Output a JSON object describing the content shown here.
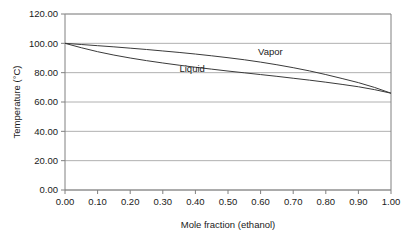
{
  "chart_data": {
    "type": "line",
    "title": "",
    "xlabel": "Mole fraction (ethanol)",
    "ylabel": "Temperature (°C)",
    "xlim": [
      0.0,
      1.0
    ],
    "ylim": [
      0.0,
      120.0
    ],
    "xticks": [
      "0.00",
      "0.10",
      "0.20",
      "0.30",
      "0.40",
      "0.50",
      "0.60",
      "0.70",
      "0.80",
      "0.90",
      "1.00"
    ],
    "xtick_values": [
      0.0,
      0.1,
      0.2,
      0.3,
      0.4,
      0.5,
      0.6,
      0.7,
      0.8,
      0.9,
      1.0
    ],
    "yticks": [
      "0.00",
      "20.00",
      "40.00",
      "60.00",
      "80.00",
      "100.00",
      "120.00"
    ],
    "ytick_values": [
      0,
      20,
      40,
      60,
      80,
      100,
      120
    ],
    "grid": "horizontal",
    "legend_position": "inline-annotation",
    "line_color": "#3a3a3a",
    "grid_color": "#b0b0b0",
    "frame_color": "#808080",
    "annotations": [
      {
        "text": "Vapor",
        "x": 0.63,
        "y": 92.0
      },
      {
        "text": "Liquid",
        "x": 0.39,
        "y": 80.5
      }
    ],
    "x": [
      0.0,
      0.05,
      0.1,
      0.15,
      0.2,
      0.25,
      0.3,
      0.35,
      0.4,
      0.45,
      0.5,
      0.55,
      0.6,
      0.65,
      0.7,
      0.75,
      0.8,
      0.85,
      0.9,
      0.95,
      1.0
    ],
    "series": [
      {
        "name": "Vapor",
        "values": [
          100.0,
          99.2,
          98.4,
          97.6,
          96.7,
          95.8,
          94.8,
          93.8,
          92.7,
          91.5,
          90.2,
          88.8,
          87.2,
          85.4,
          83.4,
          81.2,
          78.7,
          76.0,
          73.2,
          69.9,
          66.0
        ]
      },
      {
        "name": "Liquid",
        "values": [
          100.0,
          97.0,
          94.3,
          92.0,
          90.0,
          88.2,
          86.6,
          85.1,
          83.7,
          82.4,
          81.1,
          79.9,
          78.7,
          77.5,
          76.2,
          74.9,
          73.5,
          72.0,
          70.4,
          68.4,
          66.0
        ]
      }
    ]
  },
  "axes": {
    "y_title": "Temperature (°C)",
    "x_title": "Mole fraction (ethanol)"
  }
}
